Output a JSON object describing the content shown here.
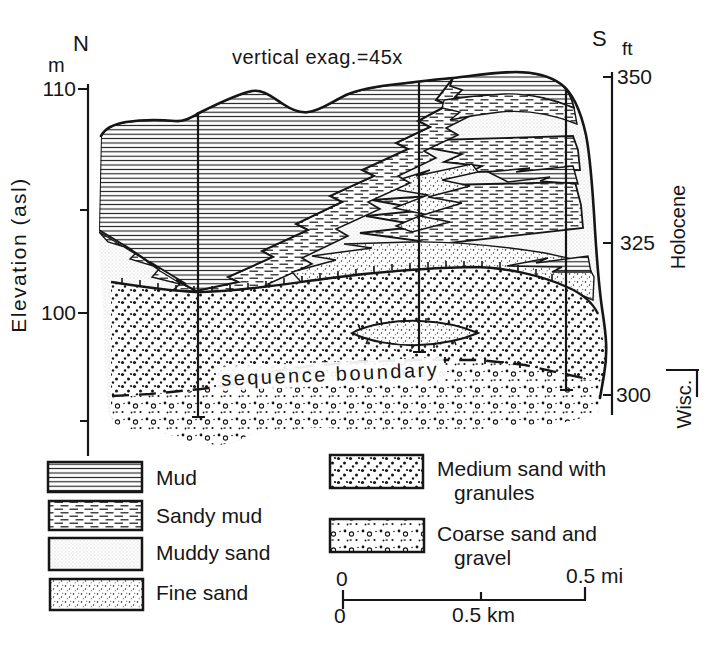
{
  "figure": {
    "vertical_exag_label": "vertical exag.=45x",
    "north_label": "N",
    "south_label": "S",
    "left_axis": {
      "unit": "m",
      "axis_label": "Elevation (asl)",
      "ticks": [
        "110",
        "100"
      ]
    },
    "right_axis": {
      "unit": "ft",
      "ticks": [
        "350",
        "325",
        "300"
      ]
    },
    "epochs": {
      "holocene": "Holocene",
      "wisconsin": "Wisc."
    },
    "sequence_boundary_label": "sequence boundary"
  },
  "legend": {
    "items": [
      {
        "label": "Mud",
        "pattern": "mud-horizontal-lines"
      },
      {
        "label": "Sandy mud",
        "pattern": "sandy-mud-dashes"
      },
      {
        "label": "Muddy sand",
        "pattern": "muddy-sand-fine-stipple"
      },
      {
        "label": "Fine sand",
        "pattern": "fine-sand-dots"
      },
      {
        "label": "Medium sand with granules",
        "pattern": "medium-sand-bold-dots"
      },
      {
        "label": "Coarse sand and gravel",
        "pattern": "coarse-sand-gravel-mix"
      }
    ]
  },
  "scale_bar": {
    "mi_start": "0",
    "mi_end": "0.5 mi",
    "km_start": "0",
    "km_end": "0.5 km"
  },
  "colors": {
    "ink": "#161616",
    "paper": "#ffffff"
  }
}
